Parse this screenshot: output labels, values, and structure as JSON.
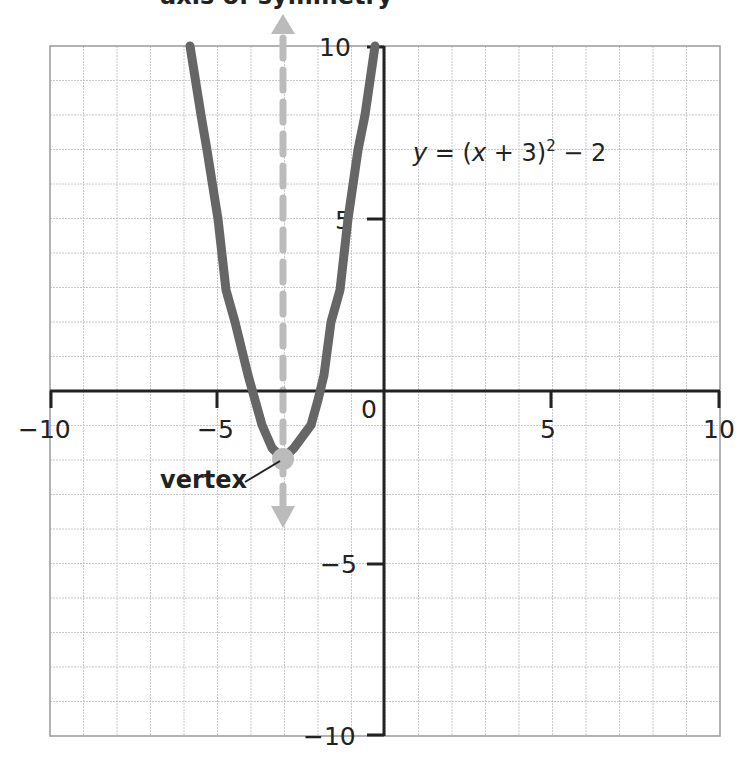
{
  "chart_data": {
    "type": "line",
    "title": "axis of symmetry",
    "xlabel": "",
    "ylabel": "",
    "xlim": [
      -10,
      10
    ],
    "ylim": [
      -10,
      10
    ],
    "grid": true,
    "x_ticks": [
      -10,
      -5,
      0,
      5,
      10
    ],
    "y_ticks": [
      -10,
      -5,
      5,
      10
    ],
    "tick_labels": {
      "x": [
        "−10",
        "−5",
        "0",
        "5",
        "10"
      ],
      "y": [
        "10",
        "5",
        "−5",
        "−10"
      ]
    },
    "series": [
      {
        "name": "y = (x + 3)² − 2",
        "equation": "y = (x + 3)^2 - 2",
        "color": "#666666",
        "x": [
          -6.5,
          -6,
          -5,
          -4.41,
          -4,
          -3,
          -2,
          -1.59,
          -1,
          0,
          0.46
        ],
        "y": [
          10.25,
          7,
          2,
          0,
          -1,
          -2,
          -1,
          0,
          2,
          7,
          10
        ]
      }
    ],
    "annotations": [
      {
        "type": "equation_label",
        "text_var": "y",
        "text_eq": " = (",
        "text_x": "x",
        "text_plus": " + 3)",
        "text_sup": "2",
        "text_tail": " − 2",
        "x": 0.9,
        "y": 7
      },
      {
        "type": "point",
        "label": "vertex",
        "x": -3,
        "y": -2,
        "color": "#bbbbbb"
      },
      {
        "type": "axis_of_symmetry",
        "x": -3,
        "style": "dashed",
        "color": "#bbbbbb",
        "arrows": "both"
      }
    ],
    "colors": {
      "curve": "#666666",
      "symmetry": "#bbbbbb",
      "axis": "#222222",
      "grid": "#c8c8c8",
      "border": "#9a9a9a"
    }
  }
}
